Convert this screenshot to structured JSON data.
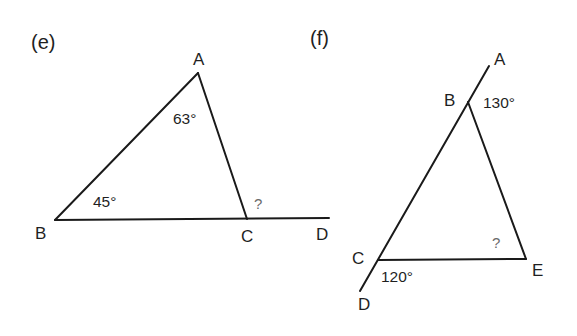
{
  "figures": [
    {
      "id": "e",
      "part_label": "(e)",
      "vertices": {
        "A": "A",
        "B": "B",
        "C": "C",
        "D": "D"
      },
      "angles": {
        "at_A": "63°",
        "at_B": "45°",
        "exterior_at_C": "?"
      },
      "segments": [
        "AB",
        "AC",
        "BD"
      ]
    },
    {
      "id": "f",
      "part_label": "(f)",
      "vertices": {
        "A": "A",
        "B": "B",
        "C": "C",
        "D": "D",
        "E": "E"
      },
      "angles": {
        "exterior_at_B": "130°",
        "exterior_at_C": "120°",
        "at_E": "?"
      },
      "segments": [
        "AD",
        "BE",
        "CE"
      ]
    }
  ],
  "colors": {
    "line": "#1a1a1a",
    "text": "#1f1f1f",
    "unknown_text": "#6a6a6a",
    "background": "#ffffff"
  }
}
